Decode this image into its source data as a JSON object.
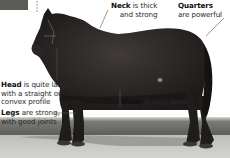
{
  "figure": {
    "annotations": {
      "head": {
        "term": "Head",
        "text_line1": " is quite large,",
        "text_line2": "with a straight or",
        "text_line3": "convex profile"
      },
      "legs": {
        "term": "Legs",
        "text_line1": " are strong,",
        "text_line2": "with good joints"
      },
      "neck": {
        "term": "Neck",
        "text_line1": " is thick",
        "text_line2": "and strong"
      },
      "quarters": {
        "term": "Quarters",
        "text_line1": "are powerful"
      },
      "body": {
        "term": "Body",
        "text_line1": " is very deep"
      }
    },
    "colors": {
      "horse": "#1f1c1c",
      "horse_highlight": "#3a3535",
      "grass": "#6f6f6a",
      "ground": "#c8c8c6",
      "shadow": "#9a9a98",
      "leader_line": "#555555",
      "text": "#2a2a2a"
    }
  }
}
